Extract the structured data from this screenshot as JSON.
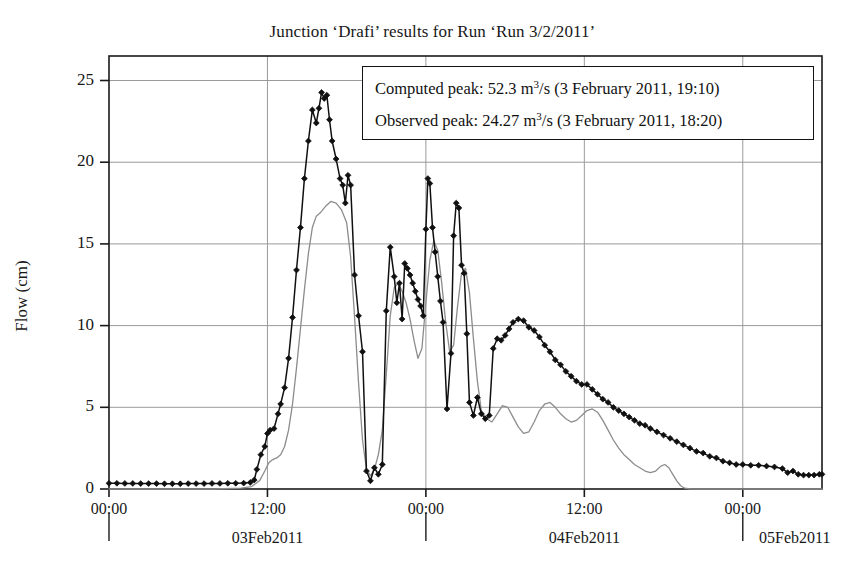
{
  "chart_data": {
    "type": "line",
    "title": "Junction ‘Drafi’ results for Run ‘Run 3/2/2011’",
    "xlabel": "",
    "ylabel": "Flow (cm)",
    "ylim": [
      0,
      26.5
    ],
    "yticks": [
      0,
      5,
      10,
      15,
      20,
      25
    ],
    "ytick_labels": [
      "0",
      "5",
      "10",
      "15",
      "20",
      "25"
    ],
    "grid": true,
    "legend_position": "top-right-inside",
    "x_axis": {
      "start": "2011-02-03 00:00",
      "end": "2011-02-05 06:00",
      "unit": "hours",
      "xlim_hours": [
        0,
        54
      ],
      "time_ticks": [
        {
          "hours": 0,
          "label": "00:00"
        },
        {
          "hours": 12,
          "label": "12:00"
        },
        {
          "hours": 24,
          "label": "00:00"
        },
        {
          "hours": 36,
          "label": "12:00"
        },
        {
          "hours": 48,
          "label": "00:00"
        }
      ],
      "date_ticks": [
        {
          "hours": 0,
          "label": "03Feb2011"
        },
        {
          "hours": 24,
          "label": "04Feb2011"
        },
        {
          "hours": 48,
          "label": "05Feb2011"
        }
      ]
    },
    "series": [
      {
        "name": "Observed",
        "color": "#101010",
        "marker": "diamond",
        "points": [
          [
            0.0,
            0.35
          ],
          [
            0.6,
            0.35
          ],
          [
            1.2,
            0.34
          ],
          [
            1.8,
            0.34
          ],
          [
            2.4,
            0.33
          ],
          [
            3.0,
            0.33
          ],
          [
            3.6,
            0.33
          ],
          [
            4.2,
            0.32
          ],
          [
            4.8,
            0.32
          ],
          [
            5.4,
            0.32
          ],
          [
            6.0,
            0.33
          ],
          [
            6.6,
            0.33
          ],
          [
            7.2,
            0.33
          ],
          [
            7.8,
            0.34
          ],
          [
            8.4,
            0.34
          ],
          [
            9.0,
            0.35
          ],
          [
            9.6,
            0.35
          ],
          [
            10.2,
            0.36
          ],
          [
            10.7,
            0.4
          ],
          [
            11.0,
            0.55
          ],
          [
            11.2,
            1.2
          ],
          [
            11.5,
            2.1
          ],
          [
            11.8,
            2.6
          ],
          [
            12.0,
            3.4
          ],
          [
            12.2,
            3.6
          ],
          [
            12.5,
            3.7
          ],
          [
            12.8,
            4.6
          ],
          [
            13.0,
            5.2
          ],
          [
            13.3,
            6.2
          ],
          [
            13.6,
            8.0
          ],
          [
            13.9,
            10.5
          ],
          [
            14.2,
            13.4
          ],
          [
            14.5,
            16.0
          ],
          [
            14.8,
            19.0
          ],
          [
            15.1,
            21.3
          ],
          [
            15.4,
            23.2
          ],
          [
            15.7,
            22.4
          ],
          [
            15.9,
            23.3
          ],
          [
            16.1,
            24.27
          ],
          [
            16.3,
            23.9
          ],
          [
            16.5,
            24.1
          ],
          [
            16.7,
            22.6
          ],
          [
            16.9,
            21.3
          ],
          [
            17.2,
            20.2
          ],
          [
            17.5,
            19.0
          ],
          [
            17.7,
            18.6
          ],
          [
            17.9,
            17.5
          ],
          [
            18.1,
            19.2
          ],
          [
            18.3,
            18.6
          ],
          [
            18.6,
            13.1
          ],
          [
            18.9,
            10.6
          ],
          [
            19.2,
            8.4
          ],
          [
            19.5,
            1.1
          ],
          [
            19.8,
            0.5
          ],
          [
            20.1,
            1.3
          ],
          [
            20.4,
            0.9
          ],
          [
            20.7,
            1.5
          ],
          [
            21.0,
            10.9
          ],
          [
            21.3,
            14.8
          ],
          [
            21.6,
            13.0
          ],
          [
            21.8,
            11.4
          ],
          [
            22.0,
            12.6
          ],
          [
            22.2,
            10.4
          ],
          [
            22.4,
            13.8
          ],
          [
            22.6,
            13.5
          ],
          [
            22.8,
            13.1
          ],
          [
            23.0,
            12.6
          ],
          [
            23.2,
            12.1
          ],
          [
            23.4,
            11.6
          ],
          [
            23.6,
            11.2
          ],
          [
            23.8,
            10.6
          ],
          [
            24.0,
            15.9
          ],
          [
            24.15,
            19.0
          ],
          [
            24.3,
            18.7
          ],
          [
            24.5,
            16.0
          ],
          [
            24.7,
            14.5
          ],
          [
            24.9,
            13.0
          ],
          [
            25.1,
            11.5
          ],
          [
            25.3,
            10.2
          ],
          [
            25.6,
            4.9
          ],
          [
            25.9,
            8.3
          ],
          [
            26.1,
            15.5
          ],
          [
            26.3,
            17.5
          ],
          [
            26.5,
            17.2
          ],
          [
            26.7,
            13.7
          ],
          [
            26.9,
            13.2
          ],
          [
            27.1,
            9.5
          ],
          [
            27.3,
            5.3
          ],
          [
            27.6,
            4.5
          ],
          [
            27.9,
            5.6
          ],
          [
            28.2,
            4.6
          ],
          [
            28.5,
            4.3
          ],
          [
            28.8,
            4.5
          ],
          [
            29.1,
            8.6
          ],
          [
            29.4,
            9.2
          ],
          [
            29.7,
            9.1
          ],
          [
            30.0,
            9.4
          ],
          [
            30.3,
            9.8
          ],
          [
            30.6,
            10.2
          ],
          [
            31.0,
            10.4
          ],
          [
            31.4,
            10.3
          ],
          [
            31.8,
            9.9
          ],
          [
            32.2,
            9.7
          ],
          [
            32.6,
            9.3
          ],
          [
            33.0,
            8.8
          ],
          [
            33.4,
            8.4
          ],
          [
            33.8,
            7.9
          ],
          [
            34.2,
            7.6
          ],
          [
            34.6,
            7.2
          ],
          [
            35.0,
            6.9
          ],
          [
            35.4,
            6.6
          ],
          [
            35.8,
            6.4
          ],
          [
            36.2,
            6.4
          ],
          [
            36.6,
            6.1
          ],
          [
            37.0,
            5.8
          ],
          [
            37.4,
            5.5
          ],
          [
            37.8,
            5.3
          ],
          [
            38.2,
            5.0
          ],
          [
            38.6,
            4.8
          ],
          [
            39.0,
            4.6
          ],
          [
            39.4,
            4.4
          ],
          [
            39.8,
            4.2
          ],
          [
            40.2,
            4.0
          ],
          [
            40.6,
            3.9
          ],
          [
            41.0,
            3.7
          ],
          [
            41.5,
            3.5
          ],
          [
            42.0,
            3.3
          ],
          [
            42.5,
            3.1
          ],
          [
            43.0,
            2.9
          ],
          [
            43.5,
            2.7
          ],
          [
            44.0,
            2.5
          ],
          [
            44.5,
            2.3
          ],
          [
            45.0,
            2.2
          ],
          [
            45.5,
            2.0
          ],
          [
            46.0,
            1.9
          ],
          [
            46.5,
            1.7
          ],
          [
            47.0,
            1.6
          ],
          [
            47.5,
            1.5
          ],
          [
            48.0,
            1.5
          ],
          [
            48.6,
            1.45
          ],
          [
            49.2,
            1.45
          ],
          [
            49.8,
            1.4
          ],
          [
            50.4,
            1.35
          ],
          [
            51.0,
            1.25
          ],
          [
            51.4,
            1.0
          ],
          [
            51.8,
            1.1
          ],
          [
            52.2,
            0.9
          ],
          [
            52.6,
            0.85
          ],
          [
            53.0,
            0.85
          ],
          [
            53.4,
            0.85
          ],
          [
            53.8,
            0.9
          ],
          [
            54.0,
            0.9
          ]
        ]
      },
      {
        "name": "Computed",
        "color": "#8c8c8c",
        "marker": "none",
        "points": [
          [
            0.0,
            0.0
          ],
          [
            4.0,
            0.0
          ],
          [
            8.0,
            0.0
          ],
          [
            10.0,
            0.05
          ],
          [
            10.8,
            0.15
          ],
          [
            11.4,
            0.5
          ],
          [
            11.8,
            1.1
          ],
          [
            12.1,
            1.6
          ],
          [
            12.4,
            1.8
          ],
          [
            12.7,
            1.9
          ],
          [
            13.0,
            2.1
          ],
          [
            13.3,
            2.6
          ],
          [
            13.6,
            3.6
          ],
          [
            13.9,
            5.2
          ],
          [
            14.2,
            7.4
          ],
          [
            14.5,
            9.8
          ],
          [
            14.8,
            12.2
          ],
          [
            15.1,
            14.4
          ],
          [
            15.4,
            16.0
          ],
          [
            15.7,
            16.7
          ],
          [
            16.0,
            16.9
          ],
          [
            16.4,
            17.3
          ],
          [
            16.8,
            17.6
          ],
          [
            17.2,
            17.5
          ],
          [
            17.6,
            17.1
          ],
          [
            18.0,
            16.3
          ],
          [
            18.3,
            14.2
          ],
          [
            18.6,
            10.5
          ],
          [
            18.9,
            6.5
          ],
          [
            19.2,
            3.0
          ],
          [
            19.5,
            1.2
          ],
          [
            19.8,
            0.8
          ],
          [
            20.1,
            1.2
          ],
          [
            20.4,
            2.1
          ],
          [
            20.7,
            3.6
          ],
          [
            21.0,
            7.0
          ],
          [
            21.3,
            10.6
          ],
          [
            21.6,
            12.3
          ],
          [
            21.9,
            12.6
          ],
          [
            22.2,
            12.1
          ],
          [
            22.5,
            11.4
          ],
          [
            22.8,
            10.4
          ],
          [
            23.1,
            9.1
          ],
          [
            23.4,
            8.0
          ],
          [
            23.7,
            8.6
          ],
          [
            24.0,
            11.4
          ],
          [
            24.3,
            14.0
          ],
          [
            24.6,
            15.2
          ],
          [
            24.9,
            14.6
          ],
          [
            25.2,
            12.6
          ],
          [
            25.5,
            10.2
          ],
          [
            25.8,
            8.4
          ],
          [
            26.1,
            8.8
          ],
          [
            26.4,
            11.2
          ],
          [
            26.7,
            13.2
          ],
          [
            27.0,
            13.5
          ],
          [
            27.3,
            12.0
          ],
          [
            27.6,
            9.2
          ],
          [
            27.9,
            6.6
          ],
          [
            28.2,
            4.8
          ],
          [
            28.6,
            4.3
          ],
          [
            29.0,
            4.1
          ],
          [
            29.4,
            4.6
          ],
          [
            29.8,
            5.1
          ],
          [
            30.2,
            5.0
          ],
          [
            30.6,
            4.4
          ],
          [
            31.0,
            3.8
          ],
          [
            31.4,
            3.4
          ],
          [
            31.8,
            3.5
          ],
          [
            32.2,
            4.1
          ],
          [
            32.6,
            4.8
          ],
          [
            33.0,
            5.2
          ],
          [
            33.4,
            5.3
          ],
          [
            33.8,
            5.0
          ],
          [
            34.2,
            4.6
          ],
          [
            34.6,
            4.3
          ],
          [
            35.0,
            4.1
          ],
          [
            35.4,
            4.2
          ],
          [
            35.8,
            4.5
          ],
          [
            36.2,
            4.8
          ],
          [
            36.6,
            4.9
          ],
          [
            37.0,
            4.7
          ],
          [
            37.4,
            4.2
          ],
          [
            37.8,
            3.6
          ],
          [
            38.2,
            3.0
          ],
          [
            38.6,
            2.5
          ],
          [
            39.0,
            2.1
          ],
          [
            39.4,
            1.8
          ],
          [
            39.8,
            1.5
          ],
          [
            40.2,
            1.3
          ],
          [
            40.6,
            1.1
          ],
          [
            41.0,
            1.0
          ],
          [
            41.4,
            1.1
          ],
          [
            41.8,
            1.4
          ],
          [
            42.1,
            1.5
          ],
          [
            42.4,
            1.3
          ],
          [
            42.7,
            0.9
          ],
          [
            43.0,
            0.5
          ],
          [
            43.3,
            0.2
          ],
          [
            43.6,
            0.05
          ],
          [
            44.0,
            0.0
          ],
          [
            48.0,
            0.0
          ],
          [
            54.0,
            0.0
          ]
        ]
      }
    ],
    "annotations": {
      "computed_peak": {
        "prefix": "Computed peak: ",
        "value": "52.3",
        "unit_base": " m",
        "unit_exp": "3",
        "unit_tail": "/s ",
        "timestamp": "(3 February 2011, 19:10)"
      },
      "observed_peak": {
        "prefix": "Observed peak: ",
        "value": "24.27",
        "unit_base": " m",
        "unit_exp": "3",
        "unit_tail": "/s ",
        "timestamp": "(3 February 2011, 18:20)"
      }
    }
  },
  "colors": {
    "observed": "#101010",
    "computed": "#8c8c8c",
    "grid": "#9a9a9a",
    "frame": "#1a1a1a"
  }
}
